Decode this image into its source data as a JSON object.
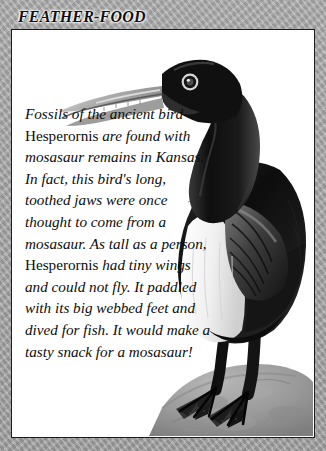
{
  "panel": {
    "title": "FEATHER-FOOD",
    "border_color": "#a5a5a5",
    "frame_color": "#1c1c1c",
    "background_color": "#ffffff"
  },
  "body": {
    "paragraph": "Fossils of the ancient bird Hesperornis are found with mosasaur remains in Kansas. In fact, this bird's long, toothed jaws were once thought to come from a mosasaur. As tall as a person, Hesperornis had tiny wings and could not fly. It paddled with its big webbed feet and dived for fish. It would make a tasty snack for a mosasaur!",
    "segments": {
      "s1": "Fossils of the ancient bird ",
      "genus1": "Hesperornis",
      "s2": " are found with mosasaur remains in Kansas. In fact, this bird's long, toothed jaws were once thought to come from a mosasaur. As tall as a person, ",
      "genus2": "Hesperornis",
      "s3": " had tiny wings and could not fly. It paddled with its big webbed feet and dived for fish. It would make a tasty snack for a mosasaur!"
    }
  },
  "illustration": {
    "subject": "hesperornis-bird",
    "description": "Grayscale illustration of a Hesperornis diving bird standing on a rock",
    "plumage_dark": "#141414",
    "plumage_light": "#f2f2f2",
    "beak_color": "#b9b9b9",
    "rock_color": "#9a9a9a"
  }
}
